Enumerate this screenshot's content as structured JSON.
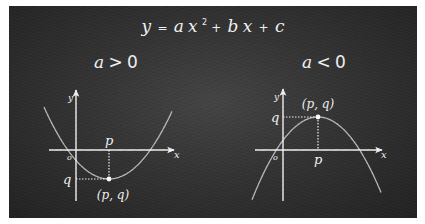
{
  "title": {
    "formula_y": "y",
    "formula_eq": "=",
    "formula_a": "a",
    "formula_x": "x",
    "formula_sup": "2",
    "formula_plus1": "+",
    "formula_b": "b",
    "formula_x2": "x",
    "formula_plus2": "+",
    "formula_c": "c"
  },
  "colors": {
    "chalk": "#f2f2f2",
    "curve": "#b8b8b8",
    "board": "#333333"
  },
  "graphs": [
    {
      "case_label_var": "a",
      "case_label_op": ">",
      "case_label_num": "0",
      "x_axis_label": "x",
      "y_axis_label": "y",
      "origin_label": "o",
      "p_label": "p",
      "q_label": "q",
      "vertex_label": "(p, q)",
      "opens": "up"
    },
    {
      "case_label_var": "a",
      "case_label_op": "<",
      "case_label_num": "0",
      "x_axis_label": "x",
      "y_axis_label": "y",
      "origin_label": "o",
      "p_label": "p",
      "q_label": "q",
      "vertex_label": "(p, q)",
      "opens": "down"
    }
  ]
}
